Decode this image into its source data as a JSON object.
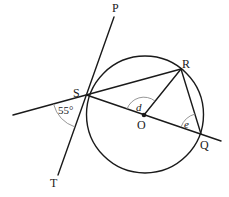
{
  "diagram": {
    "type": "circle-geometry",
    "circle": {
      "center": "O",
      "cx": 145,
      "cy": 114.5,
      "r": 58.5
    },
    "points": {
      "P": {
        "label": "P",
        "x": 114,
        "y": 17
      },
      "S": {
        "label": "S",
        "x": 86.5,
        "y": 95
      },
      "T": {
        "label": "T",
        "x": 58,
        "y": 175
      },
      "R": {
        "label": "R",
        "x": 181,
        "y": 69
      },
      "O": {
        "label": "O",
        "x": 144,
        "y": 115
      },
      "Q": {
        "label": "Q",
        "x": 201,
        "y": 134
      }
    },
    "lines": [
      {
        "name": "tangent-PT",
        "from": "P",
        "to": "T",
        "description": "tangent to circle at S"
      },
      {
        "name": "chord-SR",
        "from": "S",
        "to": "R",
        "extended_left": true
      },
      {
        "name": "diameter-SQ",
        "from": "S",
        "to": "Q",
        "through": "O",
        "extended_right": true
      },
      {
        "name": "radius-OR",
        "from": "O",
        "to": "R"
      },
      {
        "name": "chord-RQ",
        "from": "R",
        "to": "Q"
      }
    ],
    "angles": {
      "given": {
        "label": "55°",
        "vertex": "S",
        "value_deg": 55,
        "between": "extended RS and ST"
      },
      "d": {
        "label": "d",
        "vertex": "O",
        "between": "OS and OR"
      },
      "e": {
        "label": "e",
        "vertex": "Q",
        "between": "QO and QR"
      }
    }
  }
}
